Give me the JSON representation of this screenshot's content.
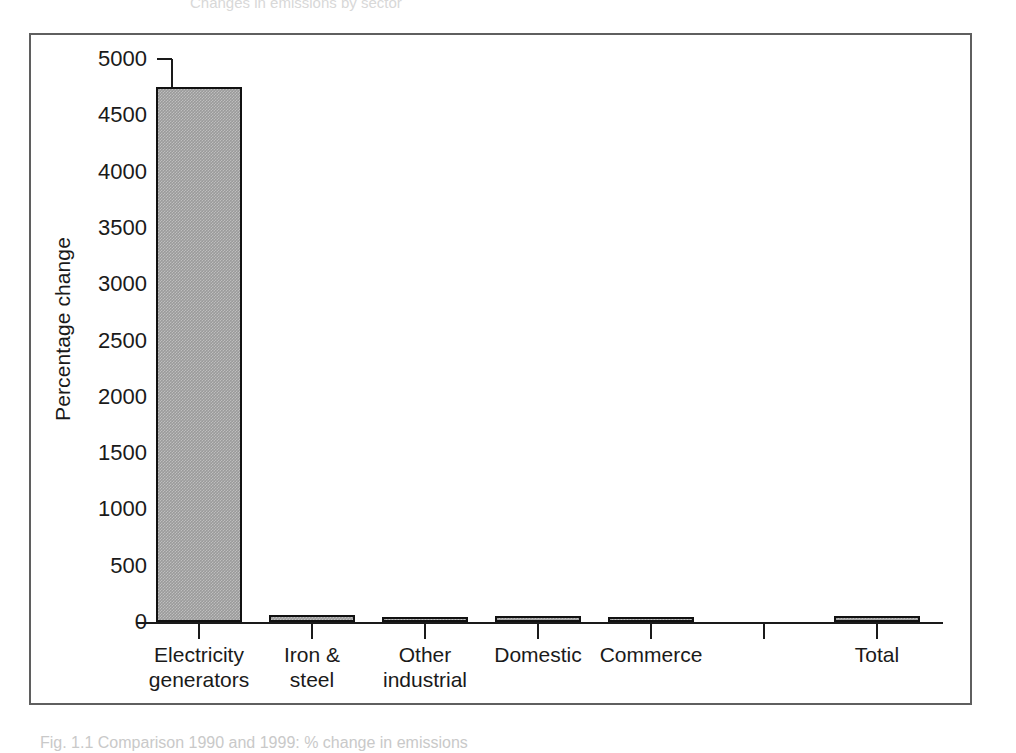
{
  "figure": {
    "ghost_header_text": "Changes in emissions by sector",
    "ghost_caption_text": "Fig. 1.1  Comparison 1990 and 1999: % change in emissions"
  },
  "chart_data": {
    "type": "bar",
    "title": "",
    "xlabel": "",
    "ylabel": "Percentage change",
    "ylim": [
      0,
      5000
    ],
    "yticks": [
      0,
      500,
      1000,
      1500,
      2000,
      2500,
      3000,
      3500,
      4000,
      4500,
      5000
    ],
    "ytick_labels": [
      "0",
      "500",
      "1000",
      "1500",
      "2000",
      "2500",
      "3000",
      "3500",
      "4000",
      "4500",
      "5000"
    ],
    "grid": false,
    "legend": false,
    "categories": [
      "Electricity\ngenerators",
      "Iron &\nsteel",
      "Other\nindustrial",
      "Domestic",
      "Commerce",
      "",
      "Total"
    ],
    "values": [
      4750,
      60,
      40,
      50,
      40,
      0,
      50
    ],
    "bar_color": "#9a9a9a",
    "bar_edge_color": "#111111"
  }
}
